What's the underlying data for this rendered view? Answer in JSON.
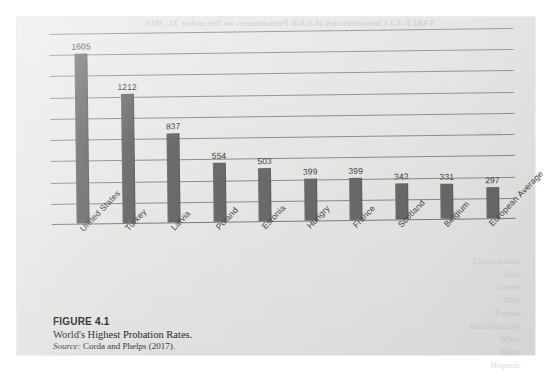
{
  "page": {
    "sheet_background": "#e9e9e7",
    "bleed_through_top": "TABLE 4.2 Characteristics of Adult Probationers on December 31, 2016",
    "bleed_through_right": [
      "Characteristic",
      "Total",
      "Gender",
      "Male",
      "Female",
      "Race/Ethnicity",
      "White",
      "Black",
      "Hispanic"
    ],
    "bleed_through_mid": "Percent"
  },
  "caption": {
    "figure_number": "FIGURE 4.1",
    "title": "World's Highest Probation Rates.",
    "source_label": "Source:",
    "source_text": "Corda and Phelps (2017)."
  },
  "chart_data": {
    "type": "bar",
    "title": "World's Highest Probation Rates",
    "xlabel": "",
    "ylabel": "",
    "categories": [
      "United States",
      "Turkey",
      "Latvia",
      "Poland",
      "Estonia",
      "Hungry",
      "France",
      "Scotland",
      "Belgium",
      "European Average"
    ],
    "values": [
      1605,
      1212,
      837,
      554,
      503,
      399,
      399,
      343,
      331,
      297
    ],
    "value_labels": [
      "1605",
      "1212",
      "837",
      "554",
      "503",
      "399",
      "399",
      "343",
      "331",
      "297"
    ],
    "ylim": [
      0,
      1800
    ],
    "gridlines": [
      200,
      400,
      600,
      800,
      1000,
      1200,
      1400,
      1600,
      1800
    ],
    "grid": true,
    "legend": false,
    "bar_color": "#6b6b6b",
    "gridline_color": "#8d8d8a",
    "axis_color": "#7e7e7b",
    "label_rotation_deg": -45
  }
}
